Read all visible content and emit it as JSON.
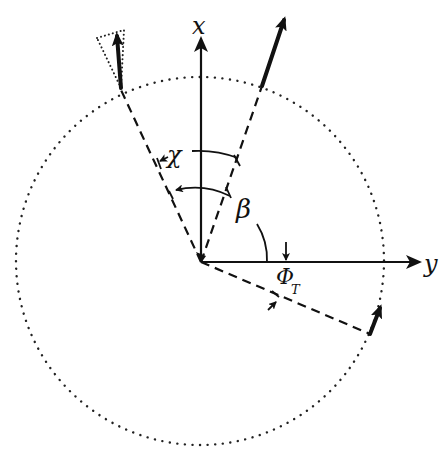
{
  "figure": {
    "type": "vector-geometry-diagram",
    "background": "#ffffff",
    "ink_color": "#111111"
  },
  "axes": {
    "x": {
      "label": "x",
      "direction": "up"
    },
    "y": {
      "label": "y",
      "direction": "right"
    }
  },
  "angles": {
    "chi": {
      "label": "χ"
    },
    "beta": {
      "label": "β"
    },
    "phi_t": {
      "label": "Φ",
      "subscript": "T"
    }
  },
  "elements": {
    "circle": {
      "style": "dotted",
      "description": "trajectory circle"
    },
    "vectors": [
      {
        "name": "vector-upper-left",
        "style": "thick",
        "with_dotted_triangle": true
      },
      {
        "name": "vector-upper-right",
        "style": "thick"
      },
      {
        "name": "vector-lower-right",
        "style": "thick"
      }
    ],
    "dashed_lines": 3
  }
}
